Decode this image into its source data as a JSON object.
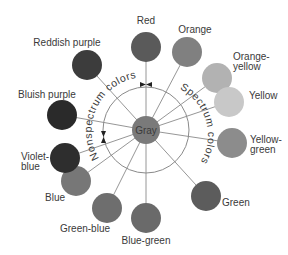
{
  "diagram": {
    "title": "",
    "center": {
      "label": "Gray",
      "x": 146,
      "y": 130,
      "r": 14,
      "color": "#7a7a7a"
    },
    "ring": {
      "r": 43,
      "color": "#8a8a8a"
    },
    "arc_labels": {
      "nonspectrum": "Nonspectrum colors",
      "spectrum": "Spectrum colors"
    },
    "nodes": [
      {
        "name": "red",
        "label": "Red",
        "x": 146,
        "y": 47,
        "r": 15,
        "color": "#5a5a5a",
        "lx": 146,
        "ly": 24,
        "anchor": "middle",
        "lines": [
          "Red"
        ]
      },
      {
        "name": "orange",
        "label": "Orange",
        "x": 187,
        "y": 52,
        "r": 15,
        "color": "#808080",
        "lx": 195,
        "ly": 33,
        "anchor": "middle",
        "lines": [
          "Orange"
        ]
      },
      {
        "name": "orange-yellow",
        "label": "Orange-yellow",
        "x": 217,
        "y": 78,
        "r": 15,
        "color": "#b2b2b2",
        "lx": 233,
        "ly": 60,
        "anchor": "start",
        "lines": [
          "Orange-",
          "yellow"
        ]
      },
      {
        "name": "yellow",
        "label": "Yellow",
        "x": 229,
        "y": 102,
        "r": 15,
        "color": "#c8c8c8",
        "lx": 249,
        "ly": 99,
        "anchor": "start",
        "lines": [
          "Yellow"
        ]
      },
      {
        "name": "yellow-green",
        "label": "Yellow-green",
        "x": 232,
        "y": 143,
        "r": 15,
        "color": "#8c8c8c",
        "lx": 250,
        "ly": 143,
        "anchor": "start",
        "lines": [
          "Yellow-",
          "green"
        ]
      },
      {
        "name": "green",
        "label": "Green",
        "x": 206,
        "y": 196,
        "r": 15,
        "color": "#5c5c5c",
        "lx": 222,
        "ly": 206,
        "anchor": "start",
        "lines": [
          "Green"
        ]
      },
      {
        "name": "blue-green",
        "label": "Blue-green",
        "x": 146,
        "y": 218,
        "r": 15,
        "color": "#6a6a6a",
        "lx": 146,
        "ly": 244,
        "anchor": "middle",
        "lines": [
          "Blue-green"
        ]
      },
      {
        "name": "green-blue",
        "label": "Green-blue",
        "x": 107,
        "y": 208,
        "r": 15,
        "color": "#6e6e6e",
        "lx": 85,
        "ly": 232,
        "anchor": "middle",
        "lines": [
          "Green-blue"
        ]
      },
      {
        "name": "blue",
        "label": "Blue",
        "x": 76,
        "y": 181,
        "r": 15,
        "color": "#777777",
        "lx": 55,
        "ly": 201,
        "anchor": "middle",
        "lines": [
          "Blue"
        ]
      },
      {
        "name": "violet-blue",
        "label": "Violet-blue",
        "x": 65,
        "y": 158,
        "r": 15,
        "color": "#2e2e2e",
        "lx": 21,
        "ly": 160,
        "anchor": "start",
        "lines": [
          "Violet-",
          "blue"
        ]
      },
      {
        "name": "bluish-purple",
        "label": "Bluish purple",
        "x": 62,
        "y": 115,
        "r": 15,
        "color": "#2a2a2a",
        "lx": 47,
        "ly": 98,
        "anchor": "middle",
        "lines": [
          "Bluish purple"
        ]
      },
      {
        "name": "reddish-purple",
        "label": "Reddish purple",
        "x": 87,
        "y": 65,
        "r": 15,
        "color": "#3c3c3c",
        "lx": 67,
        "ly": 46,
        "anchor": "middle",
        "lines": [
          "Reddish purple"
        ]
      }
    ]
  }
}
